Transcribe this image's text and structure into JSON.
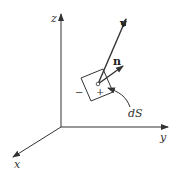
{
  "figure": {
    "axes": {
      "x_label": "x",
      "y_label": "y",
      "z_label": "z"
    },
    "vectors": {
      "v_label": "v",
      "n_label": "n"
    },
    "surface": {
      "element_label": "dS",
      "minus_side": "−",
      "plus_side": "+"
    },
    "colors": {
      "line": "#333333",
      "background": "#ffffff"
    }
  }
}
